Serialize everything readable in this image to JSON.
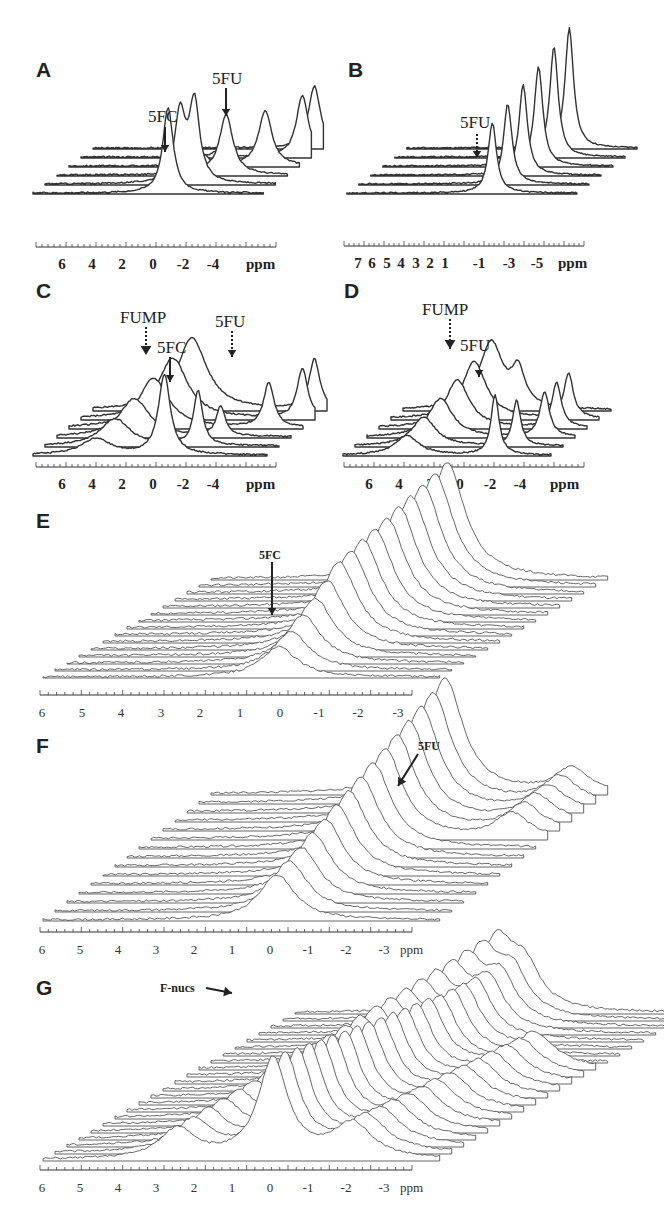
{
  "figure": {
    "panels": [
      {
        "id": "A",
        "label": "A",
        "axis_ticks": [
          "6",
          "4",
          "2",
          "0",
          "-2",
          "-4"
        ],
        "unit": "ppm",
        "annotations": [
          "5FC",
          "5FU"
        ]
      },
      {
        "id": "B",
        "label": "B",
        "axis_ticks": [
          "7",
          "6",
          "5",
          "4",
          "3",
          "2",
          "1",
          "-1",
          "-3",
          "-5"
        ],
        "unit": "ppm",
        "annotations": [
          "5FU"
        ]
      },
      {
        "id": "C",
        "label": "C",
        "axis_ticks": [
          "6",
          "4",
          "2",
          "0",
          "-2",
          "-4"
        ],
        "unit": "ppm",
        "annotations": [
          "FUMP",
          "5FC",
          "5FU"
        ]
      },
      {
        "id": "D",
        "label": "D",
        "axis_ticks": [
          "6",
          "4",
          "2",
          "0",
          "-2",
          "-4"
        ],
        "unit": "ppm",
        "annotations": [
          "FUMP",
          "5FU"
        ]
      },
      {
        "id": "E",
        "label": "E",
        "axis_ticks": [
          "6",
          "5",
          "4",
          "3",
          "2",
          "1",
          "0",
          "-1",
          "-2",
          "-3"
        ],
        "unit": "ppm",
        "annotations": [
          "5FC"
        ]
      },
      {
        "id": "F",
        "label": "F",
        "axis_ticks": [
          "6",
          "5",
          "4",
          "3",
          "2",
          "1",
          "0",
          "-1",
          "-2",
          "-3"
        ],
        "unit": "ppm",
        "annotations": [
          "5FU"
        ]
      },
      {
        "id": "G",
        "label": "G",
        "axis_ticks": [
          "6",
          "5",
          "4",
          "3",
          "2",
          "1",
          "0",
          "-1",
          "-2",
          "-3"
        ],
        "unit": "ppm",
        "annotations": [
          "F-nucs"
        ]
      }
    ]
  },
  "chart_data": [
    {
      "panel": "A",
      "type": "line",
      "title": "",
      "xlabel": "ppm",
      "ylabel": "",
      "xlim": [
        7,
        -5.5
      ],
      "num_traces": 6,
      "peaks": [
        {
          "label": "5FC",
          "ppm": -0.8
        },
        {
          "label": "5FU",
          "ppm": -4.8
        },
        {
          "label": "unlabeled",
          "ppm": 0
        }
      ],
      "tick_labels": [
        "6",
        "4",
        "2",
        "0",
        "-2",
        "-4"
      ],
      "grid": false,
      "stacked_3d": true
    },
    {
      "panel": "B",
      "type": "line",
      "title": "",
      "xlabel": "ppm",
      "ylabel": "",
      "xlim": [
        7.5,
        -6
      ],
      "num_traces": 6,
      "peaks": [
        {
          "label": "5FU",
          "ppm": -1.0
        }
      ],
      "tick_labels": [
        "7",
        "6",
        "5",
        "4",
        "3",
        "2",
        "1",
        "-1",
        "-3",
        "-5"
      ],
      "grid": false,
      "stacked_3d": true
    },
    {
      "panel": "C",
      "type": "line",
      "title": "",
      "xlabel": "ppm",
      "ylabel": "",
      "xlim": [
        7,
        -5.5
      ],
      "num_traces": 6,
      "peaks": [
        {
          "label": "FUMP",
          "ppm": 0.2
        },
        {
          "label": "5FC",
          "ppm": -1.0
        },
        {
          "label": "5FU",
          "ppm": -5.0
        },
        {
          "label": "broad",
          "ppm": 4.0
        }
      ],
      "tick_labels": [
        "6",
        "4",
        "2",
        "0",
        "-2",
        "-4"
      ],
      "grid": false,
      "stacked_3d": true
    },
    {
      "panel": "D",
      "type": "line",
      "title": "",
      "xlabel": "ppm",
      "ylabel": "",
      "xlim": [
        7,
        -5.5
      ],
      "num_traces": 6,
      "peaks": [
        {
          "label": "FUMP",
          "ppm": 0.3
        },
        {
          "label": "5FU",
          "ppm": -2.0
        },
        {
          "label": "broad",
          "ppm": 3.5
        }
      ],
      "tick_labels": [
        "6",
        "4",
        "2",
        "0",
        "-2",
        "-4"
      ],
      "grid": false,
      "stacked_3d": true
    },
    {
      "panel": "E",
      "type": "line",
      "title": "",
      "xlabel": "ppm",
      "ylabel": "",
      "xlim": [
        6,
        -3.5
      ],
      "num_traces": 15,
      "peaks": [
        {
          "label": "5FC",
          "ppm": 0.0
        }
      ],
      "tick_labels": [
        "6",
        "5",
        "4",
        "3",
        "2",
        "1",
        "0",
        "-1",
        "-2",
        "-3"
      ],
      "grid": false,
      "stacked_3d": true
    },
    {
      "panel": "F",
      "type": "line",
      "title": "",
      "xlabel": "ppm",
      "ylabel": "",
      "xlim": [
        6,
        -3.5
      ],
      "num_traces": 15,
      "peaks": [
        {
          "label": "main",
          "ppm": 0.1
        },
        {
          "label": "5FU",
          "ppm": -3.3
        }
      ],
      "tick_labels": [
        "6",
        "5",
        "4",
        "3",
        "2",
        "1",
        "0",
        "-1",
        "-2",
        "-3"
      ],
      "grid": false,
      "stacked_3d": true
    },
    {
      "panel": "G",
      "type": "line",
      "title": "",
      "xlabel": "ppm",
      "ylabel": "",
      "xlim": [
        6,
        -3.5
      ],
      "num_traces": 22,
      "peaks": [
        {
          "label": "F-nucs",
          "ppm": 1.0
        },
        {
          "label": "main",
          "ppm": 0.2
        },
        {
          "label": "side",
          "ppm": -2.0
        }
      ],
      "tick_labels": [
        "6",
        "5",
        "4",
        "3",
        "2",
        "1",
        "0",
        "-1",
        "-2",
        "-3"
      ],
      "grid": false,
      "stacked_3d": true
    }
  ]
}
